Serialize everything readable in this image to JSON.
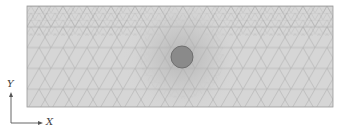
{
  "figure": {
    "domain_rect": {
      "x": 27,
      "y": 6,
      "width": 306,
      "height": 101
    },
    "inclusion": {
      "cx": 182,
      "cy": 57,
      "r": 11
    },
    "colors": {
      "domain_fill": "#d6d6d6",
      "mesh_line": "#a9a9a9",
      "border": "#9a9a9a",
      "inclusion_fill": "#8a8a8a",
      "axis": "#555555"
    }
  },
  "axes": {
    "x_label": "X",
    "y_label": "Y"
  }
}
